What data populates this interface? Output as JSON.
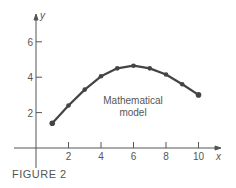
{
  "chart_data": {
    "type": "line",
    "title": "",
    "xlabel": "x",
    "ylabel": "y",
    "x": [
      1,
      2,
      3,
      4,
      5,
      6,
      7,
      8,
      9,
      10
    ],
    "series": [
      {
        "name": "Mathematical model",
        "values": [
          1.4,
          2.4,
          3.3,
          4.05,
          4.5,
          4.65,
          4.5,
          4.15,
          3.6,
          3.0
        ]
      }
    ],
    "x_ticks": [
      "2",
      "4",
      "6",
      "8",
      "10"
    ],
    "y_ticks": [
      "2",
      "4",
      "6"
    ],
    "xlim": [
      -1,
      11
    ],
    "ylim": [
      -1,
      7
    ],
    "grid": false,
    "annotations": [
      {
        "text_line1": "Mathematical",
        "text_line2": "model",
        "x": 6,
        "y": 2.8
      }
    ]
  },
  "figure": {
    "caption": "FIGURE 2"
  }
}
